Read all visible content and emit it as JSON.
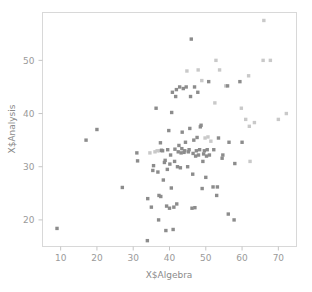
{
  "chart_data": {
    "type": "scatter",
    "title": "",
    "xlabel": "X$Algebra",
    "ylabel": "X$Analysis",
    "xlim": [
      5,
      75
    ],
    "ylim": [
      15,
      59
    ],
    "xticks": [
      10,
      20,
      30,
      40,
      50,
      60,
      70
    ],
    "yticks": [
      20,
      30,
      40,
      50
    ],
    "xtick_labels": [
      "10",
      "20",
      "30",
      "40",
      "50",
      "60",
      "70"
    ],
    "ytick_labels": [
      "20",
      "30",
      "40",
      "50"
    ],
    "grid": false,
    "legend": null,
    "marker": "square",
    "marker_size_px": 3.4,
    "colors": {
      "dark": "#8c8c8c",
      "mid": "#a8a8a8",
      "light": "#c9c9c9",
      "frame": "#d8d8d8",
      "text": "#8f8f8f",
      "background": "#ffffff"
    },
    "points": [
      {
        "x": 9.0,
        "y": 18.4,
        "shade": "dark"
      },
      {
        "x": 17.0,
        "y": 35.0,
        "shade": "dark"
      },
      {
        "x": 20.0,
        "y": 37.0,
        "shade": "dark"
      },
      {
        "x": 27.0,
        "y": 26.1,
        "shade": "dark"
      },
      {
        "x": 31.0,
        "y": 32.6,
        "shade": "dark"
      },
      {
        "x": 31.2,
        "y": 31.1,
        "shade": "dark"
      },
      {
        "x": 33.9,
        "y": 16.1,
        "shade": "dark"
      },
      {
        "x": 34.0,
        "y": 24.0,
        "shade": "dark"
      },
      {
        "x": 34.6,
        "y": 32.6,
        "shade": "light"
      },
      {
        "x": 35.0,
        "y": 22.4,
        "shade": "dark"
      },
      {
        "x": 35.4,
        "y": 29.3,
        "shade": "dark"
      },
      {
        "x": 35.6,
        "y": 30.2,
        "shade": "dark"
      },
      {
        "x": 36.0,
        "y": 32.8,
        "shade": "light"
      },
      {
        "x": 36.3,
        "y": 41.0,
        "shade": "dark"
      },
      {
        "x": 36.6,
        "y": 33.0,
        "shade": "light"
      },
      {
        "x": 36.8,
        "y": 29.0,
        "shade": "dark"
      },
      {
        "x": 37.0,
        "y": 20.0,
        "shade": "dark"
      },
      {
        "x": 37.1,
        "y": 24.6,
        "shade": "dark"
      },
      {
        "x": 37.3,
        "y": 33.0,
        "shade": "light"
      },
      {
        "x": 37.5,
        "y": 34.5,
        "shade": "dark"
      },
      {
        "x": 37.6,
        "y": 24.4,
        "shade": "dark"
      },
      {
        "x": 37.8,
        "y": 33.1,
        "shade": "dark"
      },
      {
        "x": 38.1,
        "y": 33.0,
        "shade": "dark"
      },
      {
        "x": 38.3,
        "y": 27.5,
        "shade": "dark"
      },
      {
        "x": 38.6,
        "y": 30.8,
        "shade": "dark"
      },
      {
        "x": 38.8,
        "y": 31.2,
        "shade": "dark"
      },
      {
        "x": 39.0,
        "y": 18.0,
        "shade": "dark"
      },
      {
        "x": 39.2,
        "y": 22.6,
        "shade": "dark"
      },
      {
        "x": 39.4,
        "y": 29.5,
        "shade": "dark"
      },
      {
        "x": 39.5,
        "y": 33.2,
        "shade": "dark"
      },
      {
        "x": 39.8,
        "y": 36.8,
        "shade": "dark"
      },
      {
        "x": 40.0,
        "y": 22.2,
        "shade": "dark"
      },
      {
        "x": 40.1,
        "y": 30.5,
        "shade": "dark"
      },
      {
        "x": 40.3,
        "y": 32.2,
        "shade": "dark"
      },
      {
        "x": 40.5,
        "y": 26.0,
        "shade": "dark"
      },
      {
        "x": 40.6,
        "y": 40.2,
        "shade": "dark"
      },
      {
        "x": 40.8,
        "y": 44.0,
        "shade": "dark"
      },
      {
        "x": 41.0,
        "y": 18.2,
        "shade": "dark"
      },
      {
        "x": 41.2,
        "y": 22.4,
        "shade": "dark"
      },
      {
        "x": 41.4,
        "y": 31.0,
        "shade": "dark"
      },
      {
        "x": 41.5,
        "y": 33.3,
        "shade": "dark"
      },
      {
        "x": 41.7,
        "y": 43.2,
        "shade": "dark"
      },
      {
        "x": 41.9,
        "y": 44.5,
        "shade": "dark"
      },
      {
        "x": 42.0,
        "y": 23.0,
        "shade": "dark"
      },
      {
        "x": 42.2,
        "y": 30.0,
        "shade": "dark"
      },
      {
        "x": 42.4,
        "y": 32.8,
        "shade": "dark"
      },
      {
        "x": 42.6,
        "y": 34.0,
        "shade": "dark"
      },
      {
        "x": 42.8,
        "y": 45.0,
        "shade": "dark"
      },
      {
        "x": 43.0,
        "y": 29.8,
        "shade": "dark"
      },
      {
        "x": 43.2,
        "y": 32.6,
        "shade": "dark"
      },
      {
        "x": 43.4,
        "y": 33.4,
        "shade": "dark"
      },
      {
        "x": 43.5,
        "y": 36.5,
        "shade": "dark"
      },
      {
        "x": 43.8,
        "y": 44.7,
        "shade": "dark"
      },
      {
        "x": 44.0,
        "y": 32.7,
        "shade": "dark"
      },
      {
        "x": 44.2,
        "y": 33.0,
        "shade": "dark"
      },
      {
        "x": 44.4,
        "y": 34.6,
        "shade": "dark"
      },
      {
        "x": 44.6,
        "y": 45.0,
        "shade": "dark"
      },
      {
        "x": 44.8,
        "y": 48.0,
        "shade": "light"
      },
      {
        "x": 45.0,
        "y": 30.0,
        "shade": "dark"
      },
      {
        "x": 45.2,
        "y": 32.8,
        "shade": "dark"
      },
      {
        "x": 45.4,
        "y": 33.2,
        "shade": "dark"
      },
      {
        "x": 45.6,
        "y": 37.2,
        "shade": "dark"
      },
      {
        "x": 45.8,
        "y": 43.2,
        "shade": "dark"
      },
      {
        "x": 46.0,
        "y": 54.0,
        "shade": "dark"
      },
      {
        "x": 46.2,
        "y": 22.2,
        "shade": "dark"
      },
      {
        "x": 46.4,
        "y": 28.6,
        "shade": "dark"
      },
      {
        "x": 46.5,
        "y": 32.5,
        "shade": "dark"
      },
      {
        "x": 46.7,
        "y": 35.0,
        "shade": "dark"
      },
      {
        "x": 46.9,
        "y": 45.0,
        "shade": "dark"
      },
      {
        "x": 47.0,
        "y": 22.3,
        "shade": "dark"
      },
      {
        "x": 47.2,
        "y": 32.0,
        "shade": "dark"
      },
      {
        "x": 47.4,
        "y": 33.0,
        "shade": "dark"
      },
      {
        "x": 47.6,
        "y": 35.5,
        "shade": "dark"
      },
      {
        "x": 47.8,
        "y": 44.0,
        "shade": "dark"
      },
      {
        "x": 47.9,
        "y": 48.2,
        "shade": "light"
      },
      {
        "x": 48.0,
        "y": 32.2,
        "shade": "dark"
      },
      {
        "x": 48.3,
        "y": 33.2,
        "shade": "dark"
      },
      {
        "x": 48.5,
        "y": 37.5,
        "shade": "dark"
      },
      {
        "x": 48.7,
        "y": 37.8,
        "shade": "dark"
      },
      {
        "x": 48.9,
        "y": 46.2,
        "shade": "light"
      },
      {
        "x": 49.0,
        "y": 25.9,
        "shade": "dark"
      },
      {
        "x": 49.2,
        "y": 31.0,
        "shade": "dark"
      },
      {
        "x": 49.4,
        "y": 32.4,
        "shade": "dark"
      },
      {
        "x": 49.6,
        "y": 33.0,
        "shade": "dark"
      },
      {
        "x": 49.8,
        "y": 35.4,
        "shade": "light"
      },
      {
        "x": 50.0,
        "y": 28.0,
        "shade": "dark"
      },
      {
        "x": 50.2,
        "y": 32.0,
        "shade": "dark"
      },
      {
        "x": 50.4,
        "y": 33.2,
        "shade": "dark"
      },
      {
        "x": 50.6,
        "y": 35.6,
        "shade": "light"
      },
      {
        "x": 50.8,
        "y": 46.0,
        "shade": "dark"
      },
      {
        "x": 51.0,
        "y": 32.2,
        "shade": "dark"
      },
      {
        "x": 51.4,
        "y": 34.8,
        "shade": "light"
      },
      {
        "x": 52.0,
        "y": 26.2,
        "shade": "dark"
      },
      {
        "x": 52.2,
        "y": 33.2,
        "shade": "dark"
      },
      {
        "x": 52.5,
        "y": 42.0,
        "shade": "light"
      },
      {
        "x": 52.8,
        "y": 50.0,
        "shade": "light"
      },
      {
        "x": 53.0,
        "y": 24.6,
        "shade": "dark"
      },
      {
        "x": 53.2,
        "y": 26.2,
        "shade": "dark"
      },
      {
        "x": 53.5,
        "y": 35.4,
        "shade": "dark"
      },
      {
        "x": 53.8,
        "y": 48.2,
        "shade": "light"
      },
      {
        "x": 54.5,
        "y": 31.6,
        "shade": "dark"
      },
      {
        "x": 54.7,
        "y": 32.2,
        "shade": "dark"
      },
      {
        "x": 55.5,
        "y": 45.2,
        "shade": "light"
      },
      {
        "x": 56.0,
        "y": 45.2,
        "shade": "dark"
      },
      {
        "x": 56.2,
        "y": 21.1,
        "shade": "dark"
      },
      {
        "x": 56.4,
        "y": 34.6,
        "shade": "dark"
      },
      {
        "x": 57.8,
        "y": 20.0,
        "shade": "dark"
      },
      {
        "x": 58.0,
        "y": 30.6,
        "shade": "dark"
      },
      {
        "x": 59.4,
        "y": 46.0,
        "shade": "dark"
      },
      {
        "x": 59.8,
        "y": 41.0,
        "shade": "light"
      },
      {
        "x": 60.0,
        "y": 34.6,
        "shade": "dark"
      },
      {
        "x": 61.0,
        "y": 38.9,
        "shade": "light"
      },
      {
        "x": 61.8,
        "y": 47.1,
        "shade": "light"
      },
      {
        "x": 62.0,
        "y": 37.6,
        "shade": "light"
      },
      {
        "x": 62.2,
        "y": 31.0,
        "shade": "light"
      },
      {
        "x": 63.4,
        "y": 38.3,
        "shade": "light"
      },
      {
        "x": 65.8,
        "y": 50.0,
        "shade": "light"
      },
      {
        "x": 66.0,
        "y": 57.5,
        "shade": "light"
      },
      {
        "x": 67.8,
        "y": 50.0,
        "shade": "light"
      },
      {
        "x": 70.0,
        "y": 38.9,
        "shade": "light"
      },
      {
        "x": 72.2,
        "y": 40.0,
        "shade": "light"
      }
    ]
  }
}
